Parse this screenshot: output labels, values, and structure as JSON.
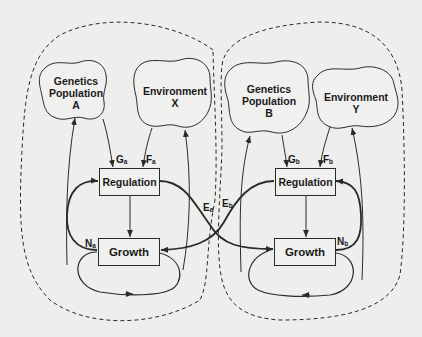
{
  "colors": {
    "background": "#eeeeec",
    "stroke": "#2a2a2a",
    "text": "#1a1a1a"
  },
  "system_a": {
    "genetics": {
      "line1": "Genetics",
      "line2": "Population",
      "line3": "A"
    },
    "environment": {
      "line1": "Environment",
      "line2": "X"
    },
    "regulation": "Regulation",
    "growth": "Growth",
    "labels": {
      "G": {
        "main": "G",
        "sub": "a"
      },
      "F": {
        "main": "F",
        "sub": "a"
      },
      "N": {
        "main": "N",
        "sub": "a"
      },
      "E": {
        "main": "E",
        "sub": "a"
      }
    }
  },
  "system_b": {
    "genetics": {
      "line1": "Genetics",
      "line2": "Population",
      "line3": "B"
    },
    "environment": {
      "line1": "Environment",
      "line2": "Y"
    },
    "regulation": "Regulation",
    "growth": "Growth",
    "labels": {
      "G": {
        "main": "G",
        "sub": "b"
      },
      "F": {
        "main": "F",
        "sub": "b"
      },
      "N": {
        "main": "N",
        "sub": "b"
      },
      "E": {
        "main": "E",
        "sub": "b"
      }
    }
  }
}
